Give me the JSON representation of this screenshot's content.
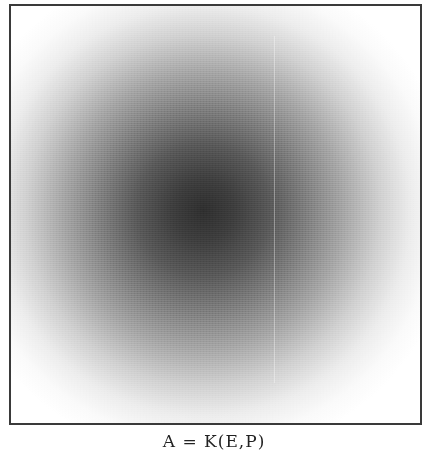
{
  "figure": {
    "caption": "A = K(E,P)"
  },
  "chart_data": {
    "type": "heatmap",
    "title": "",
    "caption": "A = K(E,P)",
    "xlabel": "",
    "ylabel": "",
    "grid": false,
    "legend": null,
    "peak": {
      "x_frac": 0.47,
      "y_frac": 0.49,
      "intensity": 0.85
    },
    "colormap": [
      "#ffffff",
      "#2e2e2e"
    ]
  }
}
